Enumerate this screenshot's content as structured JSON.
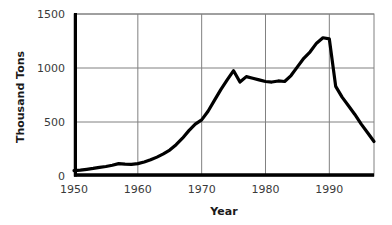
{
  "chart_data": {
    "type": "line",
    "title": "",
    "xlabel": "Year",
    "ylabel": "Thousand Tons",
    "xlim": [
      1950,
      1997
    ],
    "ylim": [
      0,
      1500
    ],
    "xticks": [
      1950,
      1960,
      1970,
      1980,
      1990
    ],
    "yticks": [
      0,
      500,
      1000,
      1500
    ],
    "xtick_labels": [
      "1950",
      "1960",
      "1970",
      "1980",
      "1990"
    ],
    "ytick_labels": [
      "0",
      "500",
      "1000",
      "1500"
    ],
    "grid": true,
    "grid_color": "#808080",
    "legend": false,
    "legend_position": "none",
    "line_color": "#000000",
    "line_width": 3.2,
    "axis_color": "#000000",
    "background": "#ffffff",
    "x": [
      1950,
      1951,
      1952,
      1953,
      1954,
      1955,
      1956,
      1957,
      1958,
      1959,
      1960,
      1961,
      1962,
      1963,
      1964,
      1965,
      1966,
      1967,
      1968,
      1969,
      1970,
      1971,
      1972,
      1973,
      1974,
      1975,
      1976,
      1977,
      1978,
      1979,
      1980,
      1981,
      1982,
      1983,
      1984,
      1985,
      1986,
      1987,
      1988,
      1989,
      1990,
      1991,
      1992,
      1993,
      1994,
      1995,
      1996,
      1997
    ],
    "values": [
      50,
      55,
      62,
      70,
      80,
      88,
      100,
      115,
      110,
      108,
      115,
      130,
      150,
      175,
      205,
      240,
      290,
      350,
      420,
      480,
      520,
      600,
      700,
      800,
      890,
      975,
      870,
      920,
      905,
      890,
      875,
      870,
      880,
      875,
      930,
      1010,
      1090,
      1150,
      1230,
      1280,
      1270,
      830,
      730,
      650,
      570,
      480,
      400,
      320
    ],
    "series": [
      {
        "name": "Thousand Tons",
        "values": [
          50,
          55,
          62,
          70,
          80,
          88,
          100,
          115,
          110,
          108,
          115,
          130,
          150,
          175,
          205,
          240,
          290,
          350,
          420,
          480,
          520,
          600,
          700,
          800,
          890,
          975,
          870,
          920,
          905,
          890,
          875,
          870,
          880,
          875,
          930,
          1010,
          1090,
          1150,
          1230,
          1280,
          1270,
          830,
          730,
          650,
          570,
          480,
          400,
          320
        ]
      }
    ],
    "annotations": []
  }
}
